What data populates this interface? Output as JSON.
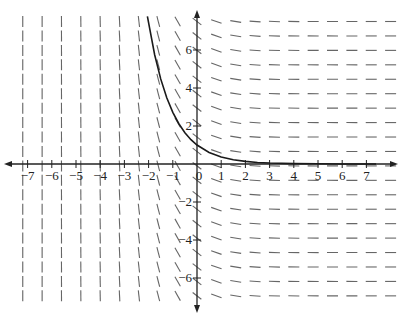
{
  "chart_data": {
    "type": "line",
    "title": "",
    "subtitle": "Slope field for dy/dx = -e^(-x) with solution curve y = e^(-x)",
    "xlabel": "",
    "ylabel": "",
    "xlim": [
      -7.5,
      7.5
    ],
    "ylim": [
      -7.5,
      7.5
    ],
    "grid": false,
    "legend": null,
    "x_ticks": [
      -7,
      -6,
      -5,
      -4,
      -3,
      -2,
      -1,
      0,
      1,
      2,
      3,
      4,
      5,
      6,
      7
    ],
    "x_tick_labels": [
      "−7",
      "−6",
      "−5",
      "−4",
      "−3",
      "−2",
      "−1",
      "0",
      "1",
      "2",
      "3",
      "4",
      "5",
      "6",
      "7"
    ],
    "y_ticks": [
      -6,
      -4,
      -2,
      2,
      4,
      6
    ],
    "y_tick_labels": [
      "−6",
      "−4",
      "−2",
      "2",
      "4",
      "6"
    ],
    "slope_field": {
      "equation": "dy/dx = -e^(-x)",
      "x_start": -7.2,
      "x_step": 0.8,
      "x_count": 20,
      "y_start": 7.5,
      "y_step": -0.76,
      "y_count": 20
    },
    "series": [
      {
        "name": "solution curve y = e^(-x)",
        "x": [
          -2.05,
          -1.75,
          -1.5,
          -1.25,
          -1,
          -0.75,
          -0.5,
          -0.25,
          0,
          0.5,
          1,
          1.5,
          2,
          2.5,
          3,
          4,
          5,
          6,
          7,
          7.4
        ],
        "y": [
          7.77,
          5.75,
          4.48,
          3.49,
          2.72,
          2.12,
          1.65,
          1.28,
          1.0,
          0.61,
          0.37,
          0.22,
          0.14,
          0.08,
          0.05,
          0.02,
          0.01,
          0.0,
          0.0,
          0.0
        ]
      }
    ]
  },
  "colors": {
    "axis": "#222222",
    "slope_marks": "#666666",
    "curve": "#1a1a1a",
    "background": "#ffffff"
  }
}
